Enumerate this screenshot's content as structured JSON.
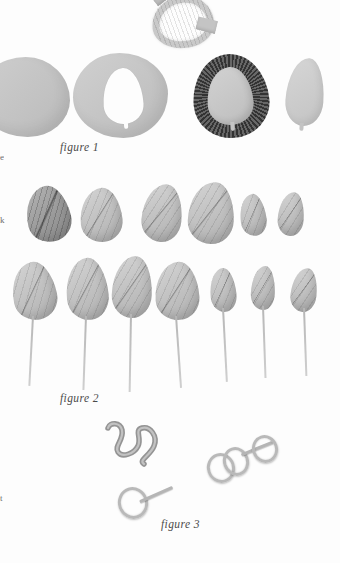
{
  "page": {
    "kind": "scanned-craft-instruction-page",
    "background_color": "#fdfdfd",
    "ink_color": "#4a4a4a"
  },
  "captions": [
    {
      "id": "figure-1",
      "text": "figure 1",
      "x": 60,
      "y": 141
    },
    {
      "id": "figure-2",
      "text": "figure 2",
      "x": 60,
      "y": 392
    },
    {
      "id": "figure-3",
      "text": "figure 3",
      "x": 161,
      "y": 518
    }
  ],
  "margin_text": [
    {
      "id": "margin-fragment-1",
      "text": "e",
      "y": 152
    },
    {
      "id": "margin-fragment-2",
      "text": "k",
      "y": 215
    },
    {
      "id": "margin-fragment-3",
      "text": "t",
      "y": 493
    }
  ],
  "figure1": {
    "label": "figure 1",
    "description": "Pattern pieces: solid fabric blob, blob with leaf cut out, dark fringed leaf, plain leaf cut-out, and a folded strip loop above.",
    "pieces": [
      {
        "id": "blob-solid",
        "name": "solid-fabric-blob",
        "shade": "#c6c6c6"
      },
      {
        "id": "blob-cutout",
        "name": "blob-with-leaf-cutout",
        "shade": "#c6c6c6"
      },
      {
        "id": "fringed-leaf",
        "name": "dark-fringed-leaf",
        "shade": "#3b3b3b"
      },
      {
        "id": "plain-leaf",
        "name": "plain-leaf-cutout",
        "shade": "#c9c9c9"
      },
      {
        "id": "folded-strip",
        "name": "folded-strip-loop",
        "shade": "#c9c9c9"
      }
    ]
  },
  "figure2": {
    "label": "figure 2",
    "description": "Two rows of finished crimped fabric leaves; the lower row has wire stems attached.",
    "row_top": [
      {
        "id": "leaf-t1",
        "x": 26,
        "y": 186,
        "w": 44,
        "h": 56,
        "rot": -14,
        "dark": true
      },
      {
        "id": "leaf-t2",
        "x": 80,
        "y": 188,
        "w": 42,
        "h": 54,
        "rot": -6,
        "dark": false
      },
      {
        "id": "leaf-t3",
        "x": 142,
        "y": 184,
        "w": 40,
        "h": 58,
        "rot": 5,
        "dark": false
      },
      {
        "id": "leaf-t4",
        "x": 188,
        "y": 182,
        "w": 46,
        "h": 62,
        "rot": 2,
        "dark": false
      },
      {
        "id": "leaf-t5",
        "x": 240,
        "y": 194,
        "w": 26,
        "h": 42,
        "rot": -8,
        "dark": false
      },
      {
        "id": "leaf-t6",
        "x": 278,
        "y": 192,
        "w": 26,
        "h": 44,
        "rot": 4,
        "dark": false
      }
    ],
    "row_bottom": [
      {
        "id": "leaf-b1",
        "x": 12,
        "y": 262,
        "w": 44,
        "h": 58,
        "rot": -12,
        "stem_len": 70,
        "stem_rot": 3
      },
      {
        "id": "leaf-b2",
        "x": 66,
        "y": 258,
        "w": 42,
        "h": 62,
        "rot": -6,
        "stem_len": 74,
        "stem_rot": 2
      },
      {
        "id": "leaf-b3",
        "x": 112,
        "y": 256,
        "w": 40,
        "h": 62,
        "rot": 2,
        "stem_len": 78,
        "stem_rot": 1
      },
      {
        "id": "leaf-b4",
        "x": 155,
        "y": 262,
        "w": 44,
        "h": 58,
        "rot": -4,
        "stem_len": 72,
        "stem_rot": -4
      },
      {
        "id": "leaf-b5",
        "x": 210,
        "y": 268,
        "w": 26,
        "h": 44,
        "rot": -6,
        "stem_len": 74,
        "stem_rot": -3
      },
      {
        "id": "leaf-b6",
        "x": 251,
        "y": 266,
        "w": 24,
        "h": 44,
        "rot": 2,
        "stem_len": 72,
        "stem_rot": -2
      },
      {
        "id": "leaf-b7",
        "x": 291,
        "y": 268,
        "w": 26,
        "h": 44,
        "rot": 6,
        "stem_len": 68,
        "stem_rot": -2
      }
    ]
  },
  "figure3": {
    "label": "figure 3",
    "description": "A coiled wire tendril above a diagonal wooden dowel with wires wrapped and knotted around it.",
    "rod": {
      "name": "wooden-dowel",
      "angle_deg": -20.5,
      "shade": "#8f8f8f"
    },
    "coil": {
      "name": "wire-tendril-coil",
      "shade": "#9a9a9a"
    },
    "wraps": [
      {
        "id": "wrap-1",
        "x": 124,
        "y": 490
      },
      {
        "id": "wrap-2",
        "x": 214,
        "y": 456
      },
      {
        "id": "wrap-3",
        "x": 252,
        "y": 444
      }
    ]
  }
}
